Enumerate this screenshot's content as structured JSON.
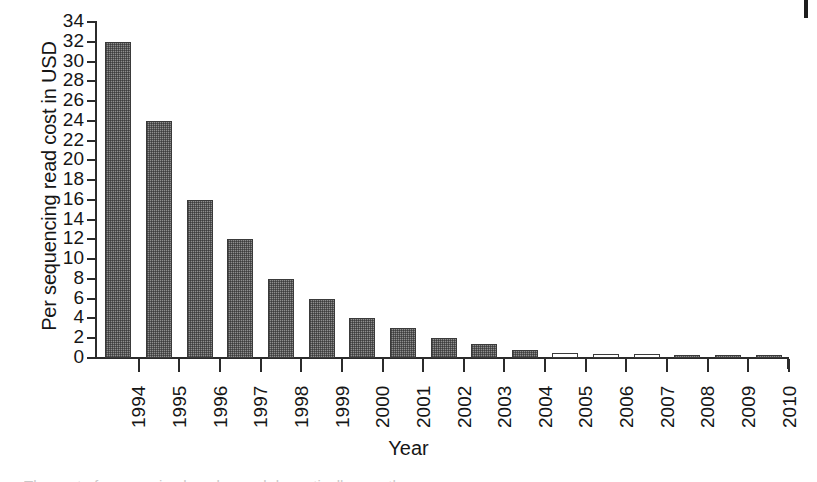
{
  "chart_data": {
    "type": "bar",
    "title": "",
    "xlabel": "Year",
    "ylabel": "Per sequencing read cost in USD",
    "categories": [
      "1994",
      "1995",
      "1996",
      "1997",
      "1998",
      "1999",
      "2000",
      "2001",
      "2002",
      "2003",
      "2004",
      "2005",
      "2006",
      "2007",
      "2008",
      "2009",
      "2010"
    ],
    "values": [
      32,
      24,
      16,
      12,
      8,
      6,
      4,
      3,
      2,
      1.4,
      0.8,
      0.5,
      0.4,
      0.45,
      0.2,
      0.15,
      0.15
    ],
    "ylim": [
      0,
      34
    ],
    "ytick_labels": [
      "0",
      "2",
      "4",
      "6",
      "8",
      "10",
      "12",
      "14",
      "16",
      "18",
      "20",
      "22",
      "24",
      "26",
      "28",
      "30",
      "32",
      "34"
    ],
    "ytick_values": [
      0,
      2,
      4,
      6,
      8,
      10,
      12,
      14,
      16,
      18,
      20,
      22,
      24,
      26,
      28,
      30,
      32,
      34
    ],
    "ytick_step": 2,
    "grid": false,
    "legend": null,
    "bar_fill_style": [
      "hatched",
      "hatched",
      "hatched",
      "hatched",
      "hatched",
      "hatched",
      "hatched",
      "hatched",
      "hatched",
      "hatched",
      "hatched",
      "hollow",
      "hollow",
      "hollow",
      "hatched",
      "hatched",
      "hatched"
    ],
    "colors": {
      "bar_fill": "#8e8e8e",
      "bar_edge": "#3a3a3a",
      "axis": "#2b2b2b",
      "text": "#161616",
      "background": "#ffffff"
    }
  },
  "figure": {
    "caption_sliver": "The cost of sequencing has dropped dramatically over the years"
  }
}
